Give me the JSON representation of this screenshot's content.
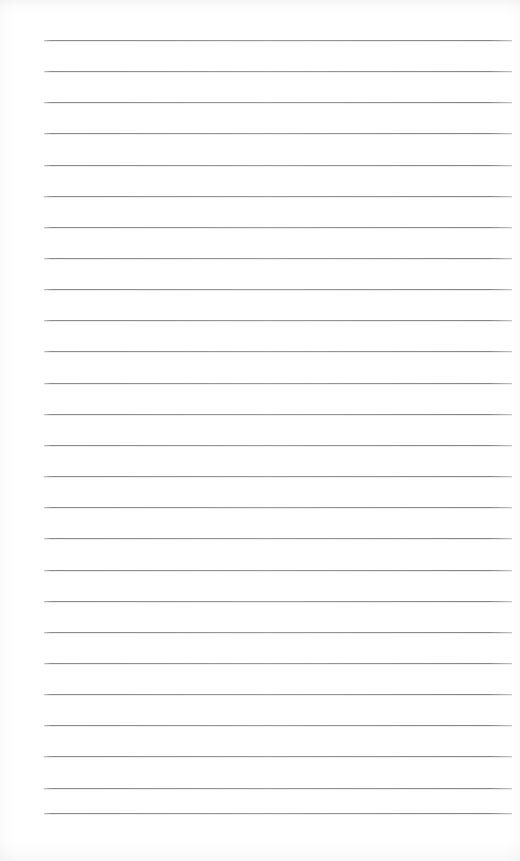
{
  "document": {
    "kind": "lined-paper",
    "title": "",
    "body_text": "",
    "written_content": "",
    "page_width": 520,
    "page_height": 861
  },
  "paper": {
    "background_color": "#fefefe",
    "edge_tint_color": "#f7f7f8"
  },
  "rules": {
    "line_color": "#8a8a8d",
    "line_count": 26,
    "line_thickness": 1,
    "line_spacing": 31.1,
    "first_line_y": 40,
    "last_line_y": 813,
    "left_x": 44,
    "right_x": 512,
    "line_length": 468,
    "vertical_margin_rule": false
  },
  "lines": [
    {
      "index": 1,
      "y": 40,
      "x1": 44,
      "x2": 512
    },
    {
      "index": 2,
      "y": 71,
      "x1": 44,
      "x2": 512
    },
    {
      "index": 3,
      "y": 102,
      "x1": 44,
      "x2": 512
    },
    {
      "index": 4,
      "y": 133,
      "x1": 44,
      "x2": 512
    },
    {
      "index": 5,
      "y": 165,
      "x1": 44,
      "x2": 512
    },
    {
      "index": 6,
      "y": 196,
      "x1": 44,
      "x2": 512
    },
    {
      "index": 7,
      "y": 227,
      "x1": 44,
      "x2": 512
    },
    {
      "index": 8,
      "y": 258,
      "x1": 44,
      "x2": 512
    },
    {
      "index": 9,
      "y": 289,
      "x1": 44,
      "x2": 512
    },
    {
      "index": 10,
      "y": 320,
      "x1": 44,
      "x2": 512
    },
    {
      "index": 11,
      "y": 351,
      "x1": 44,
      "x2": 512
    },
    {
      "index": 12,
      "y": 383,
      "x1": 44,
      "x2": 512
    },
    {
      "index": 13,
      "y": 414,
      "x1": 44,
      "x2": 512
    },
    {
      "index": 14,
      "y": 445,
      "x1": 44,
      "x2": 512
    },
    {
      "index": 15,
      "y": 476,
      "x1": 44,
      "x2": 512
    },
    {
      "index": 16,
      "y": 507,
      "x1": 44,
      "x2": 512
    },
    {
      "index": 17,
      "y": 538,
      "x1": 44,
      "x2": 512
    },
    {
      "index": 18,
      "y": 570,
      "x1": 44,
      "x2": 512
    },
    {
      "index": 19,
      "y": 601,
      "x1": 44,
      "x2": 512
    },
    {
      "index": 20,
      "y": 632,
      "x1": 44,
      "x2": 512
    },
    {
      "index": 21,
      "y": 663,
      "x1": 44,
      "x2": 512
    },
    {
      "index": 22,
      "y": 694,
      "x1": 44,
      "x2": 512
    },
    {
      "index": 23,
      "y": 725,
      "x1": 44,
      "x2": 512
    },
    {
      "index": 24,
      "y": 756,
      "x1": 44,
      "x2": 512
    },
    {
      "index": 25,
      "y": 788,
      "x1": 44,
      "x2": 512
    },
    {
      "index": 26,
      "y": 813,
      "x1": 44,
      "x2": 512
    }
  ]
}
